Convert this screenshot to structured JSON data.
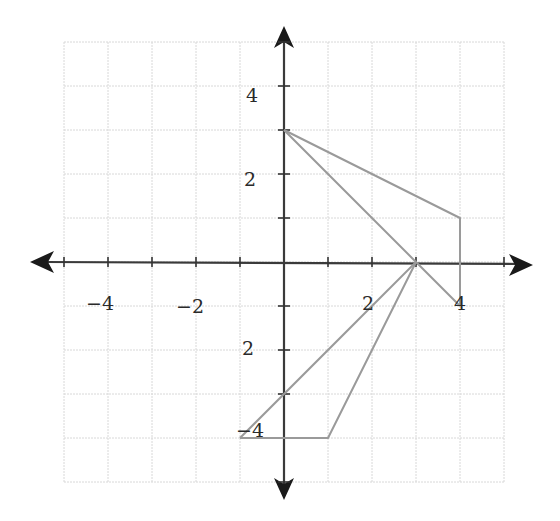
{
  "chart_data": {
    "type": "line",
    "title": "",
    "xlabel": "",
    "ylabel": "",
    "xlim": [
      -5,
      5
    ],
    "ylim": [
      -5,
      5
    ],
    "grid": true,
    "x_ticks": [
      -4,
      -2,
      2,
      4
    ],
    "y_ticks": [
      4,
      2,
      -2,
      -4
    ],
    "x_tick_labels": [
      "-4",
      "-2",
      "2",
      "4"
    ],
    "y_tick_labels": [
      "4",
      "2",
      "2",
      "-4"
    ],
    "series": [
      {
        "name": "segment-a",
        "points": [
          [
            0,
            3
          ],
          [
            4,
            1
          ],
          [
            4,
            -1
          ]
        ]
      },
      {
        "name": "segment-b",
        "points": [
          [
            0,
            3
          ],
          [
            3,
            0
          ],
          [
            4,
            -1
          ]
        ]
      },
      {
        "name": "segment-c",
        "points": [
          [
            -1,
            -4
          ],
          [
            3,
            0
          ]
        ]
      },
      {
        "name": "segment-d",
        "points": [
          [
            -1,
            -4
          ],
          [
            1,
            -4
          ],
          [
            3,
            0
          ]
        ]
      }
    ],
    "legend": null
  },
  "layout": {
    "origin_px": [
      284,
      262
    ],
    "unit_px": 44,
    "colors": {
      "axis": "#3a3a3a",
      "grid": "#d8d8d8",
      "series": "#9a9a9a",
      "text": "#2a2a2a"
    }
  },
  "labels": {
    "x_neg4": "−4",
    "x_neg2": "−2",
    "x_2": "2",
    "x_4": "4",
    "y_4": "4",
    "y_2": "2",
    "y_neg2": "2",
    "y_neg4": "−4"
  }
}
